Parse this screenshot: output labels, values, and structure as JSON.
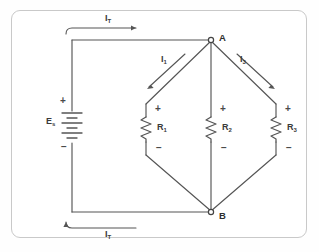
{
  "figure": {
    "type": "parallel-resistive-circuit-schematic",
    "background": "#ffffff",
    "line_color": "#555555",
    "frame_color": "#c9c9c9"
  },
  "source": {
    "label": "E",
    "subscript": "s",
    "plus": "+",
    "minus": "−"
  },
  "nodes": {
    "top": "A",
    "bottom": "B"
  },
  "currents": {
    "total_top": {
      "symbol": "I",
      "subscript": "T"
    },
    "total_bottom": {
      "symbol": "I",
      "subscript": "T"
    },
    "branch1": {
      "symbol": "I",
      "subscript": "1"
    },
    "branch3": {
      "symbol": "I",
      "subscript": "3"
    }
  },
  "resistors": [
    {
      "label": "R",
      "subscript": "1",
      "plus": "+",
      "minus": "−"
    },
    {
      "label": "R",
      "subscript": "2",
      "plus": "+",
      "minus": "−"
    },
    {
      "label": "R",
      "subscript": "3",
      "plus": "+",
      "minus": "−"
    }
  ]
}
